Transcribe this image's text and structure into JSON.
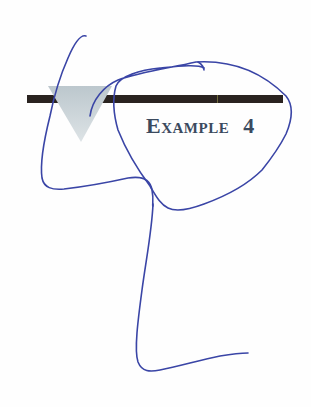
{
  "document": {
    "heading": {
      "label": "Example",
      "number": "4"
    },
    "decorations": {
      "header_bar_color": "#2a2320",
      "triangle_color": "#c9d3d8",
      "heading_color": "#3b4a5e"
    },
    "annotations": {
      "ink_color": "#3a45a6",
      "description": "hand-drawn blue pen strokes over the page"
    }
  }
}
